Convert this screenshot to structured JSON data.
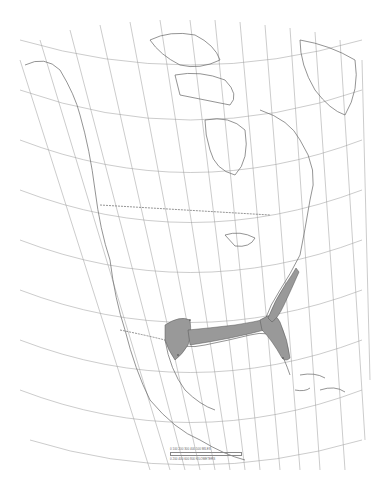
{
  "map": {
    "subject": "North America species range map",
    "projection": "conic graticule",
    "range_fill_color": "#999999",
    "line_color": "#777777",
    "range_regions": [
      "Texas",
      "Gulf Coast (Louisiana, Mississippi, Alabama)",
      "Florida",
      "Atlantic coast (Georgia, Carolinas)"
    ],
    "scale_bar": {
      "top_labels": "0 100 200 300 400 500 MILES",
      "bottom_labels": "0 200 400 600 800 KILOMETERS"
    }
  }
}
